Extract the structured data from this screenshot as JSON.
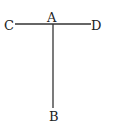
{
  "diagram": {
    "type": "line-figure",
    "line_color": "#333333",
    "points": {
      "A": {
        "label": "A",
        "x": 53,
        "y": 24
      },
      "B": {
        "label": "B",
        "x": 53,
        "y": 108
      },
      "C": {
        "label": "C",
        "x": 15,
        "y": 24
      },
      "D": {
        "label": "D",
        "x": 91,
        "y": 24
      }
    },
    "segments": [
      {
        "from": "C",
        "to": "D"
      },
      {
        "from": "A",
        "to": "B"
      }
    ]
  }
}
